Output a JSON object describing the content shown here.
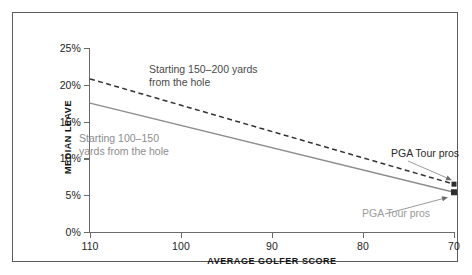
{
  "chart_data": {
    "type": "line",
    "title": "",
    "xlabel": "AVERAGE GOLFER SCORE",
    "ylabel": "MEDIAN LEAVE",
    "xlim": [
      110,
      70
    ],
    "ylim": [
      0,
      25
    ],
    "x_ticks": [
      "110",
      "100",
      "90",
      "80",
      "70"
    ],
    "x_tick_values": [
      110,
      100,
      90,
      80,
      70
    ],
    "y_ticks": [
      "0%",
      "5%",
      "10%",
      "15%",
      "20%",
      "25%"
    ],
    "y_tick_values": [
      0,
      5,
      10,
      15,
      20,
      25
    ],
    "x_axis_reversed": true,
    "grid": false,
    "legend": "annotations",
    "series": [
      {
        "name": "Starting 150–200 yards from the hole",
        "style": "dashed",
        "color": "#333333",
        "x": [
          110,
          70
        ],
        "values": [
          20.8,
          6.5
        ],
        "endpoint_marker": {
          "x": 70,
          "value": 6.5,
          "shape": "square"
        }
      },
      {
        "name": "Starting 100–150 yards from the hole",
        "style": "solid",
        "color": "#8c8c8c",
        "x": [
          110,
          70
        ],
        "values": [
          17.5,
          5.4
        ],
        "endpoint_marker": {
          "x": 70,
          "value": 5.4,
          "shape": "square"
        }
      }
    ],
    "annotations": [
      {
        "id": "note-long",
        "text": "Starting 150–200 yards\nfrom the hole",
        "color": "#4a4a4a"
      },
      {
        "id": "note-short",
        "text": "Starting 100–150\nyards from the hole",
        "color": "#8d8d8d"
      },
      {
        "id": "pga-upper",
        "text": "PGA Tour pros",
        "color": "#2a2a2a",
        "points_to": {
          "x": 70,
          "value": 6.5
        }
      },
      {
        "id": "pga-lower",
        "text": "PGA Tour pros",
        "color": "#9a9a9a",
        "points_to": {
          "x": 70,
          "value": 5.4
        }
      }
    ]
  },
  "colors": {
    "frame": "#5c5c5c",
    "axis": "#6b6b6b",
    "dashed_series": "#333333",
    "solid_series": "#8c8c8c",
    "background": "#ffffff"
  }
}
